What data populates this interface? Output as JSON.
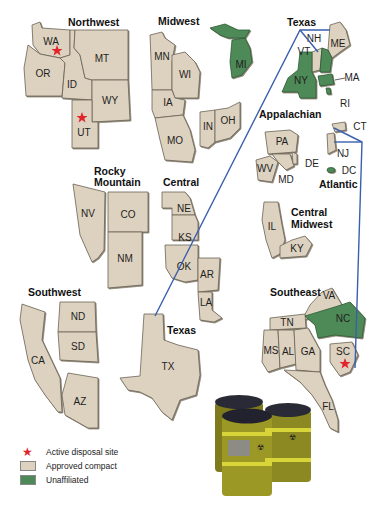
{
  "regions": [
    {
      "name": "Northwest",
      "states": [
        "WA",
        "OR",
        "ID",
        "MT",
        "WY",
        "UT"
      ],
      "status": "Approved compact",
      "disposal_sites": [
        "WA",
        "UT"
      ]
    },
    {
      "name": "Midwest",
      "states": [
        "MN",
        "WI",
        "IA",
        "MO",
        "IN",
        "OH"
      ],
      "status": "Approved compact"
    },
    {
      "name": "Texas",
      "states": [
        "TX",
        "VT",
        "ME"
      ],
      "status": "Approved compact"
    },
    {
      "name": "Rocky Mountain",
      "states": [
        "NV",
        "CO",
        "NM"
      ],
      "status": "Approved compact"
    },
    {
      "name": "Central",
      "states": [
        "NE",
        "KS",
        "OK",
        "AR",
        "LA"
      ],
      "status": "Approved compact"
    },
    {
      "name": "Appalachian",
      "states": [
        "PA",
        "WV",
        "MD",
        "DE"
      ],
      "status": "Approved compact"
    },
    {
      "name": "Atlantic",
      "states": [
        "CT",
        "NJ",
        "SC"
      ],
      "status": "Approved compact",
      "disposal_sites": [
        "SC"
      ]
    },
    {
      "name": "Central Midwest",
      "states": [
        "IL",
        "KY"
      ],
      "status": "Approved compact"
    },
    {
      "name": "Southeast",
      "states": [
        "VA",
        "TN",
        "MS",
        "AL",
        "GA",
        "FL"
      ],
      "status": "Approved compact"
    },
    {
      "name": "Southwest",
      "states": [
        "CA",
        "ND",
        "SD",
        "AZ"
      ],
      "status": "Approved compact"
    }
  ],
  "unaffiliated": [
    "MI",
    "NY",
    "NH",
    "MA",
    "RI",
    "DC",
    "NC"
  ],
  "labels": {
    "northwest": "Northwest",
    "midwest": "Midwest",
    "texas_top": "Texas",
    "texas_bottom": "Texas",
    "rocky1": "Rocky",
    "rocky2": "Mountain",
    "central": "Central",
    "appalachian": "Appalachian",
    "atlantic": "Atlantic",
    "cmw1": "Central",
    "cmw2": "Midwest",
    "southeast": "Southeast",
    "southwest": "Southwest"
  },
  "states": {
    "WA": "WA",
    "OR": "OR",
    "ID": "ID",
    "MT": "MT",
    "WY": "WY",
    "UT": "UT",
    "MN": "MN",
    "WI": "WI",
    "IA": "IA",
    "MO": "MO",
    "IN": "IN",
    "OH": "OH",
    "MI": "MI",
    "VT": "VT",
    "NH": "NH",
    "ME": "ME",
    "NY": "NY",
    "MA": "MA",
    "RI": "RI",
    "PA": "PA",
    "WV": "WV",
    "MD": "MD",
    "DE": "DE",
    "CT": "CT",
    "NJ": "NJ",
    "DC": "DC",
    "IL": "IL",
    "KY": "KY",
    "NV": "NV",
    "CO": "CO",
    "NM": "NM",
    "NE": "NE",
    "KS": "KS",
    "OK": "OK",
    "AR": "AR",
    "LA": "LA",
    "ND": "ND",
    "SD": "SD",
    "CA": "CA",
    "AZ": "AZ",
    "TX": "TX",
    "VA": "VA",
    "TN": "TN",
    "NC": "NC",
    "MS": "MS",
    "AL": "AL",
    "GA": "GA",
    "SC": "SC",
    "FL": "FL"
  },
  "legend": {
    "active": "Active disposal site",
    "approved": "Approved compact",
    "unaffiliated": "Unaffiliated"
  },
  "colors": {
    "approved": "#ddd2bf",
    "unaffiliated": "#4e8a58",
    "star": "#e0252d",
    "link": "#3a5fae"
  }
}
